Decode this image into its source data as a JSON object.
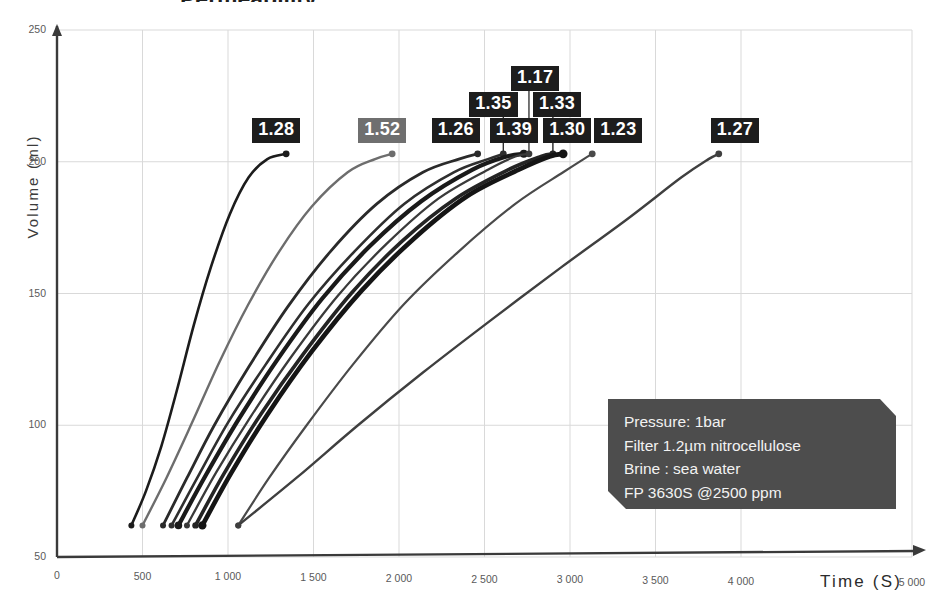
{
  "chart_data": {
    "type": "line",
    "title": "Permeability",
    "xlabel": "Time (S)",
    "ylabel": "Volume (ml)",
    "xlim": [
      0,
      5000
    ],
    "ylim": [
      50,
      250
    ],
    "xticks": [
      "0",
      "500",
      "1 000",
      "1 500",
      "2 000",
      "2 500",
      "3 000",
      "3 500",
      "4 000",
      "5 000"
    ],
    "xtick_values": [
      0,
      500,
      1000,
      1500,
      2000,
      2500,
      3000,
      3500,
      4000,
      5000
    ],
    "yticks": [
      "50",
      "100",
      "150",
      "200",
      "250"
    ],
    "ytick_values": [
      50,
      100,
      150,
      200,
      250
    ],
    "grid": true,
    "legend": "none",
    "series": [
      {
        "name": "run-1.28",
        "label": "1.28",
        "color": "#1c1c1c",
        "width": 2.6,
        "label_style": "dark",
        "points": [
          [
            435,
            62
          ],
          [
            520,
            75
          ],
          [
            610,
            92
          ],
          [
            700,
            113
          ],
          [
            800,
            138
          ],
          [
            900,
            160
          ],
          [
            1010,
            180
          ],
          [
            1120,
            194
          ],
          [
            1230,
            201
          ],
          [
            1340,
            203
          ]
        ]
      },
      {
        "name": "run-1.52",
        "label": "1.52",
        "color": "#6d6d6d",
        "width": 2.4,
        "label_style": "light",
        "points": [
          [
            500,
            62
          ],
          [
            640,
            80
          ],
          [
            790,
            101
          ],
          [
            950,
            124
          ],
          [
            1120,
            146
          ],
          [
            1300,
            166
          ],
          [
            1490,
            183
          ],
          [
            1700,
            196
          ],
          [
            1860,
            201
          ],
          [
            1960,
            203
          ]
        ]
      },
      {
        "name": "run-1.26",
        "label": "1.26",
        "color": "#2a2a2a",
        "width": 2.8,
        "label_style": "dark",
        "points": [
          [
            620,
            62
          ],
          [
            760,
            80
          ],
          [
            920,
            100
          ],
          [
            1120,
            122
          ],
          [
            1350,
            145
          ],
          [
            1600,
            166
          ],
          [
            1870,
            184
          ],
          [
            2140,
            196
          ],
          [
            2350,
            201
          ],
          [
            2460,
            203
          ]
        ]
      },
      {
        "name": "run-1.35",
        "label": "1.35",
        "color": "#2f2f2f",
        "width": 2.6,
        "label_style": "dark",
        "points": [
          [
            670,
            62
          ],
          [
            820,
            80
          ],
          [
            1000,
            101
          ],
          [
            1220,
            123
          ],
          [
            1470,
            146
          ],
          [
            1740,
            166
          ],
          [
            2030,
            184
          ],
          [
            2320,
            196
          ],
          [
            2520,
            201
          ],
          [
            2610,
            203
          ]
        ]
      },
      {
        "name": "run-1.39",
        "label": "1.39",
        "color": "#1a1a1a",
        "width": 4.2,
        "label_style": "dark",
        "points": [
          [
            710,
            62
          ],
          [
            870,
            81
          ],
          [
            1060,
            102
          ],
          [
            1290,
            125
          ],
          [
            1550,
            148
          ],
          [
            1830,
            168
          ],
          [
            2130,
            185
          ],
          [
            2430,
            197
          ],
          [
            2630,
            202
          ],
          [
            2730,
            203
          ]
        ]
      },
      {
        "name": "run-1.17",
        "label": "1.17",
        "color": "#3a3a3a",
        "width": 2.3,
        "label_style": "dark",
        "points": [
          [
            760,
            62
          ],
          [
            930,
            82
          ],
          [
            1130,
            103
          ],
          [
            1370,
            126
          ],
          [
            1640,
            149
          ],
          [
            1930,
            169
          ],
          [
            2230,
            186
          ],
          [
            2520,
            197
          ],
          [
            2680,
            202
          ],
          [
            2760,
            203
          ]
        ]
      },
      {
        "name": "run-1.33",
        "label": "1.33",
        "color": "#242424",
        "width": 3.6,
        "label_style": "dark",
        "points": [
          [
            810,
            62
          ],
          [
            980,
            82
          ],
          [
            1190,
            104
          ],
          [
            1440,
            127
          ],
          [
            1720,
            150
          ],
          [
            2020,
            170
          ],
          [
            2330,
            186
          ],
          [
            2640,
            197
          ],
          [
            2830,
            202
          ],
          [
            2900,
            203
          ]
        ]
      },
      {
        "name": "run-1.30",
        "label": "1.30",
        "color": "#151515",
        "width": 4.6,
        "label_style": "dark",
        "points": [
          [
            850,
            62
          ],
          [
            1020,
            82
          ],
          [
            1230,
            104
          ],
          [
            1490,
            128
          ],
          [
            1780,
            151
          ],
          [
            2090,
            171
          ],
          [
            2400,
            187
          ],
          [
            2700,
            197
          ],
          [
            2880,
            202
          ],
          [
            2960,
            203
          ]
        ]
      },
      {
        "name": "run-1.23",
        "label": "1.23",
        "color": "#4a4a4a",
        "width": 2.2,
        "label_style": "dark",
        "points": [
          [
            1060,
            62
          ],
          [
            1240,
            80
          ],
          [
            1460,
            100
          ],
          [
            1730,
            123
          ],
          [
            2030,
            146
          ],
          [
            2350,
            166
          ],
          [
            2680,
            184
          ],
          [
            2960,
            196
          ],
          [
            3080,
            201
          ],
          [
            3130,
            203
          ]
        ]
      },
      {
        "name": "run-1.27",
        "label": "1.27",
        "color": "#3f3f3f",
        "width": 2.4,
        "label_style": "dark",
        "points": [
          [
            1060,
            62
          ],
          [
            1400,
            80
          ],
          [
            1760,
            100
          ],
          [
            2140,
            120
          ],
          [
            2540,
            140
          ],
          [
            2950,
            160
          ],
          [
            3330,
            178
          ],
          [
            3650,
            194
          ],
          [
            3810,
            201
          ],
          [
            3870,
            203
          ]
        ]
      }
    ],
    "annotations": [
      {
        "name": "info-box",
        "lines": [
          "Pressure: 1bar",
          "Filter 1.2µm nitrocellulose",
          "Brine : sea water",
          "FP 3630S  @2500 ppm"
        ]
      }
    ]
  },
  "axes": {
    "y_title": "Volume (ml)",
    "x_title": "Time (S)"
  },
  "info_box": {
    "line1": "Pressure: 1bar",
    "line2": "Filter 1.2µm nitrocellulose",
    "line3": "Brine : sea water",
    "line4": "FP 3630S  @2500 ppm"
  },
  "colors": {
    "grid": "#d9d9d9",
    "axis": "#3a3a3a",
    "label_bg_dark": "#1d1d1d",
    "label_bg_light": "#6f6f6f",
    "info_bg": "#4d4d4d",
    "info_text": "#f2f2f2"
  }
}
